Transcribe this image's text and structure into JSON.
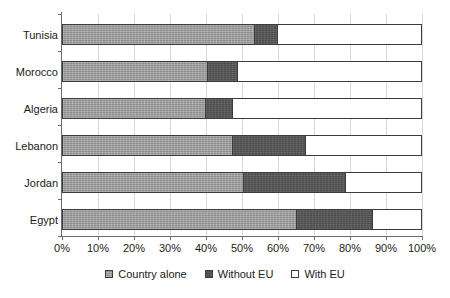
{
  "chart_data": {
    "type": "bar",
    "orientation": "horizontal",
    "stacked": true,
    "stack_mode": "percent",
    "title": "",
    "subtitle": "",
    "xlabel": "",
    "ylabel": "",
    "xlim": [
      0,
      100
    ],
    "grid": true,
    "legend_position": "bottom",
    "categories": [
      "Tunisia",
      "Morocco",
      "Algeria",
      "Lebanon",
      "Jordan",
      "Egypt"
    ],
    "tick_labels": [
      "0%",
      "10%",
      "20%",
      "30%",
      "40%",
      "50%",
      "60%",
      "70%",
      "80%",
      "90%",
      "100%"
    ],
    "tick_values": [
      0,
      10,
      20,
      30,
      40,
      50,
      60,
      70,
      80,
      90,
      100
    ],
    "series": [
      {
        "name": "Country alone",
        "color": "#9a9a9a",
        "values": [
          53.5,
          40.5,
          40.0,
          47.5,
          50.5,
          65.5
        ]
      },
      {
        "name": "Without EU",
        "color": "#545454",
        "values": [
          6.5,
          8.5,
          7.5,
          20.5,
          28.5,
          21.0
        ]
      },
      {
        "name": "With EU",
        "color": "#ffffff",
        "values": [
          40.0,
          51.0,
          52.5,
          32.0,
          21.0,
          13.5
        ]
      }
    ]
  },
  "legend": {
    "items": [
      {
        "label": "Country alone",
        "swatch": "light-gray-swatch"
      },
      {
        "label": "Without EU",
        "swatch": "dark-gray-swatch"
      },
      {
        "label": "With EU",
        "swatch": "white-swatch"
      }
    ]
  },
  "colors": {
    "country_alone": "#9a9a9a",
    "without_eu": "#545454",
    "with_eu": "#ffffff",
    "axis": "#6b6b6b",
    "gridline": "#d9d9d9",
    "bar_border": "#3b3b3b",
    "text": "#1a1a1a"
  }
}
